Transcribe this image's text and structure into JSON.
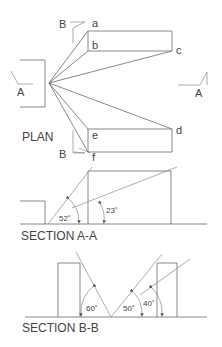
{
  "plan": {
    "title": "PLAN",
    "points": {
      "a": "a",
      "b": "b",
      "c": "c",
      "d": "d",
      "e": "e",
      "f": "f"
    },
    "section_marks": {
      "A_left": "A",
      "A_right": "A",
      "B_top": "B",
      "B_bottom": "B"
    }
  },
  "section_aa": {
    "title": "SECTION A-A",
    "angles": [
      "52˚",
      "23˚"
    ]
  },
  "section_bb": {
    "title": "SECTION B-B",
    "angles": [
      "60˚",
      "50˚",
      "40˚"
    ]
  }
}
